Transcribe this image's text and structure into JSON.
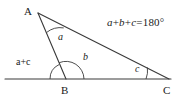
{
  "figure": {
    "type": "geometry-diagram",
    "width": 188,
    "height": 100,
    "background_color": "#ffffff",
    "stroke_color": "#3a3a3a",
    "text_color": "#1a1a1a"
  },
  "vertices": [
    {
      "name": "A",
      "label": "A",
      "x": 38,
      "y": 13,
      "label_x": 24,
      "label_y": 6
    },
    {
      "name": "B",
      "label": "B",
      "x": 66,
      "y": 79,
      "label_x": 61,
      "label_y": 85
    },
    {
      "name": "C",
      "label": "C",
      "x": 169,
      "y": 79,
      "label_x": 163,
      "label_y": 85
    }
  ],
  "base_line": {
    "x1": 5,
    "y1": 79,
    "x2": 171,
    "y2": 79
  },
  "angle_labels": [
    {
      "id": "angle-a",
      "text": "a",
      "x": 58,
      "y": 32,
      "vertex": "A"
    },
    {
      "id": "angle-b",
      "text": "b",
      "x": 83,
      "y": 52,
      "vertex": "B"
    },
    {
      "id": "angle-c",
      "text": "c",
      "x": 135,
      "y": 64,
      "vertex": "C"
    }
  ],
  "exterior_angle": {
    "id": "exterior-angle-a-plus-c",
    "text": "a+c",
    "x": 16,
    "y": 57,
    "vertex": "B"
  },
  "equation": {
    "id": "angle-sum-equation",
    "text": "a+b+c=180°",
    "terms": [
      "a",
      "b",
      "c"
    ],
    "sum": "180",
    "degree_symbol": "°",
    "x": 107,
    "y": 17
  }
}
